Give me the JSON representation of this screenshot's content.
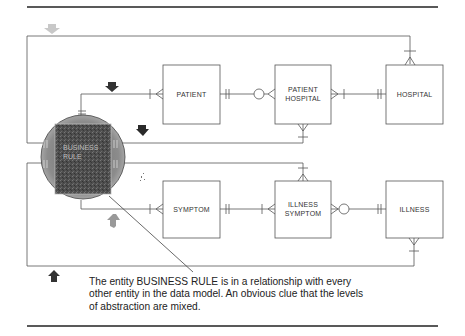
{
  "diagram": {
    "type": "entity-relationship",
    "central_entity": {
      "label_line1": "BUSINESS",
      "label_line2": "RULE",
      "highlight": "circle-gray"
    },
    "entities": [
      {
        "id": "patient",
        "label_line1": "PATIENT",
        "label_line2": ""
      },
      {
        "id": "patient_hospital",
        "label_line1": "PATIENT",
        "label_line2": "HOSPITAL"
      },
      {
        "id": "hospital",
        "label_line1": "HOSPITAL",
        "label_line2": ""
      },
      {
        "id": "symptom",
        "label_line1": "SYMPTOM",
        "label_line2": ""
      },
      {
        "id": "illness_symptom",
        "label_line1": "ILLNESS",
        "label_line2": "SYMPTOM"
      },
      {
        "id": "illness",
        "label_line1": "ILLNESS",
        "label_line2": ""
      }
    ],
    "relationships": [
      {
        "from": "BUSINESS RULE",
        "to": "HOSPITAL"
      },
      {
        "from": "BUSINESS RULE",
        "to": "PATIENT"
      },
      {
        "from": "BUSINESS RULE",
        "to": "PATIENT HOSPITAL"
      },
      {
        "from": "BUSINESS RULE",
        "to": "ILLNESS SYMPTOM"
      },
      {
        "from": "BUSINESS RULE",
        "to": "SYMPTOM"
      },
      {
        "from": "BUSINESS RULE",
        "to": "ILLNESS"
      },
      {
        "from": "PATIENT",
        "to": "PATIENT HOSPITAL"
      },
      {
        "from": "HOSPITAL",
        "to": "PATIENT HOSPITAL"
      },
      {
        "from": "SYMPTOM",
        "to": "ILLNESS SYMPTOM"
      },
      {
        "from": "ILLNESS",
        "to": "ILLNESS SYMPTOM"
      }
    ],
    "markers": [
      "arrow-down-gray",
      "arrow-down-dark",
      "arrow-down-dark",
      "arrow-up-gray",
      "arrow-up-dark",
      "sparkle-marks"
    ]
  },
  "caption": {
    "line1": "The entity BUSINESS RULE is in a relationship with every",
    "line2": "other entity in the data model.  An obvious clue that the levels",
    "line3": "of abstraction are mixed."
  },
  "colors": {
    "line": "#555555",
    "rule": "#222222",
    "circle": "#8a8a8a",
    "square": "#5a5a5a"
  }
}
